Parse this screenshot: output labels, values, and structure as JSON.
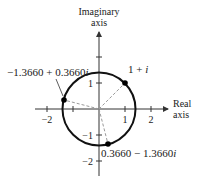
{
  "diagram": {
    "type": "complex-plane",
    "axes": {
      "vertical_label_line1": "Imaginary",
      "vertical_label_line2": "axis",
      "horizontal_label_line1": "Real",
      "horizontal_label_line2": "axis"
    },
    "ticks": {
      "x": [
        {
          "value": -2,
          "label": "−2"
        },
        {
          "value": -1,
          "label": ""
        },
        {
          "value": 1,
          "label": "1"
        },
        {
          "value": 2,
          "label": "2"
        }
      ],
      "y": [
        {
          "value": 2,
          "label": ""
        },
        {
          "value": 1,
          "label": "1"
        },
        {
          "value": -1,
          "label": "−1"
        },
        {
          "value": -2,
          "label": "−2"
        }
      ]
    },
    "circle": {
      "center": [
        0,
        0
      ],
      "radius": 1.4142
    },
    "points": [
      {
        "label": "1 + i",
        "re": 1.0,
        "im": 1.0
      },
      {
        "label": "−1.3660 + 0.3660i",
        "re": -1.366,
        "im": 0.366
      },
      {
        "label": "0.3660 − 1.3660i",
        "re": 0.366,
        "im": -1.366
      }
    ],
    "labels": {
      "p1_main": "1 + ",
      "p1_i": "i",
      "p2_main": "−1.3660 + 0.3660",
      "p2_i": "i",
      "p3_main": "0.3660 − 1.3660",
      "p3_i": "i"
    },
    "colors": {
      "circle": "#111111",
      "axes": "#333333",
      "dashed_radii": "#9a9a9a",
      "points": "#000000"
    }
  }
}
